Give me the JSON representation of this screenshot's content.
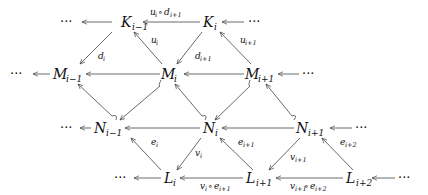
{
  "diagram": {
    "type": "commutative-diagram",
    "nodes": [
      {
        "id": "K_im1",
        "base": "K",
        "sub": "i−1",
        "x": 130,
        "y": 22
      },
      {
        "id": "K_i",
        "base": "K",
        "sub": "i",
        "x": 209,
        "y": 22
      },
      {
        "id": "M_im1",
        "base": "M",
        "sub": "i−1",
        "x": 70,
        "y": 74
      },
      {
        "id": "M_i",
        "base": "M",
        "sub": "i",
        "x": 169,
        "y": 74
      },
      {
        "id": "M_ip1",
        "base": "M",
        "sub": "i+1",
        "x": 267,
        "y": 74
      },
      {
        "id": "N_im1",
        "base": "N",
        "sub": "i−1",
        "x": 110,
        "y": 128
      },
      {
        "id": "N_i",
        "base": "N",
        "sub": "i",
        "x": 208,
        "y": 128
      },
      {
        "id": "N_ip1",
        "base": "N",
        "sub": "i+1",
        "x": 308,
        "y": 128
      },
      {
        "id": "L_i",
        "base": "L",
        "sub": "i",
        "x": 168,
        "y": 178
      },
      {
        "id": "L_ip1",
        "base": "L",
        "sub": "i+1",
        "x": 264,
        "y": 178
      },
      {
        "id": "L_ip2",
        "base": "L",
        "sub": "i+2",
        "x": 355,
        "y": 178
      }
    ],
    "ellipsis": "···",
    "edge_labels": {
      "u_d": {
        "base": "u",
        "sub1": "i",
        "op": "∘",
        "base2": "d",
        "sub2": "i+1"
      },
      "u_i": {
        "base": "u",
        "sub": "i"
      },
      "u_ip1": {
        "base": "u",
        "sub": "i+1"
      },
      "d_i": {
        "base": "d",
        "sub": "i"
      },
      "d_ip1": {
        "base": "d",
        "sub": "i+1"
      },
      "e_i": {
        "base": "e",
        "sub": "i"
      },
      "e_ip1": {
        "base": "e",
        "sub": "i+1"
      },
      "e_ip2": {
        "base": "e",
        "sub": "i+2"
      },
      "v_i": {
        "base": "v",
        "sub": "i"
      },
      "v_ip1": {
        "base": "v",
        "sub": "i+1"
      },
      "v_e1": {
        "base": "v",
        "sub1": "i",
        "op": "∘",
        "base2": "e",
        "sub2": "i+1"
      },
      "v_e2": {
        "base": "v",
        "sub1": "i+1",
        "op": "∘",
        "base2": "e",
        "sub2": "i+2"
      }
    }
  }
}
